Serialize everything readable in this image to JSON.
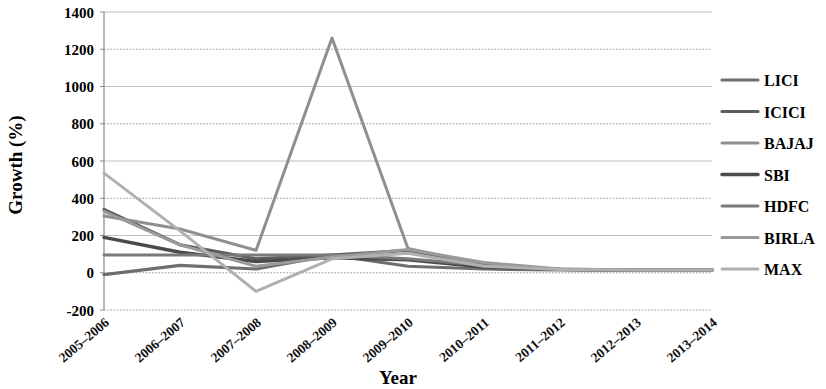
{
  "chart_data": {
    "type": "line",
    "title": "",
    "xlabel": "Year",
    "ylabel": "Growth (%)",
    "ylim": [
      -200,
      1400
    ],
    "yticks": [
      -200,
      0,
      200,
      400,
      600,
      800,
      1000,
      1200,
      1400
    ],
    "ytick_labels": [
      "-200",
      "0",
      "200",
      "400",
      "600",
      "800",
      "1000",
      "1200",
      "1400"
    ],
    "grid": true,
    "legend_position": "right",
    "categories": [
      "2005–2006",
      "2006–2007",
      "2007–2008",
      "2008–2009",
      "2009–2010",
      "2010–2011",
      "2011–2012",
      "2012–2013",
      "2013–2014"
    ],
    "series": [
      {
        "name": "LICI",
        "color": "#6e6e6e",
        "width": 3.2,
        "values": [
          -10,
          40,
          20,
          95,
          35,
          20,
          15,
          15,
          15
        ]
      },
      {
        "name": "ICICI",
        "color": "#5c5c5c",
        "width": 3.2,
        "values": [
          340,
          150,
          75,
          95,
          120,
          40,
          18,
          15,
          15
        ]
      },
      {
        "name": "BAJAJ",
        "color": "#8f8f8f",
        "width": 3.0,
        "values": [
          305,
          235,
          120,
          1260,
          130,
          45,
          18,
          15,
          15
        ]
      },
      {
        "name": "SBI",
        "color": "#4a4a4a",
        "width": 3.4,
        "values": [
          190,
          110,
          60,
          80,
          70,
          30,
          18,
          15,
          15
        ]
      },
      {
        "name": "HDFC",
        "color": "#7a7a7a",
        "width": 3.0,
        "values": [
          95,
          95,
          95,
          95,
          75,
          40,
          18,
          15,
          15
        ]
      },
      {
        "name": "BIRLA",
        "color": "#9a9a9a",
        "width": 3.0,
        "values": [
          330,
          150,
          35,
          85,
          125,
          55,
          20,
          15,
          15
        ]
      },
      {
        "name": "MAX",
        "color": "#b0b0b0",
        "width": 3.0,
        "values": [
          535,
          225,
          -100,
          75,
          105,
          35,
          18,
          15,
          15
        ]
      }
    ]
  },
  "legend": {
    "items": [
      {
        "label": "LICI"
      },
      {
        "label": "ICICI"
      },
      {
        "label": "BAJAJ"
      },
      {
        "label": "SBI"
      },
      {
        "label": "HDFC"
      },
      {
        "label": "BIRLA"
      },
      {
        "label": "MAX"
      }
    ]
  }
}
